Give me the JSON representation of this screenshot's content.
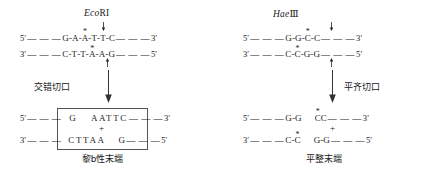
{
  "diagram": {
    "title_hidden": "Restriction enzyme cutting patterns",
    "panels": [
      {
        "id": "ecori",
        "enzyme": {
          "italic_part": "Eco",
          "roman_part": "RI"
        },
        "top_strand": {
          "five_prime": "5′",
          "three_prime": "3′",
          "left_flank": "— — —",
          "right_flank": "— — —",
          "bases": [
            "G",
            "A",
            "A",
            "T",
            "T",
            "C"
          ],
          "starred_index": 2,
          "cut_after_index": 0
        },
        "bottom_strand": {
          "five_prime": "5′",
          "three_prime": "3′",
          "left_flank": "— — —",
          "right_flank": "— — —",
          "bases": [
            "C",
            "T",
            "T",
            "A",
            "A",
            "G"
          ],
          "starred_index": 3,
          "cut_after_index": 4
        },
        "process_label": "交错切口",
        "process_label_side": "left",
        "product": {
          "boxed": true,
          "top": {
            "five_prime": "5′",
            "three_prime": "3′",
            "left_flank": "— — —",
            "right_flank": "— — —",
            "left_fragment": [
              "G"
            ],
            "right_fragment": [
              "A",
              "A",
              "T",
              "T",
              "C"
            ]
          },
          "bottom": {
            "five_prime": "5′",
            "three_prime": "3′",
            "left_flank": "— — —",
            "right_flank": "— — —",
            "left_fragment": [
              "C",
              "T",
              "T",
              "A",
              "A"
            ],
            "right_fragment": [
              "G"
            ]
          },
          "plus": "+",
          "result_label": "黎b性末端"
        }
      },
      {
        "id": "haeiii",
        "enzyme": {
          "italic_part": "Hae",
          "roman_part": "Ⅲ"
        },
        "top_strand": {
          "five_prime": "5′",
          "three_prime": "3′",
          "left_flank": "— — —",
          "right_flank": "— — —",
          "bases": [
            "G",
            "G",
            "C",
            "C"
          ],
          "starred_index": 2,
          "cut_after_index": 1
        },
        "bottom_strand": {
          "five_prime": "5′",
          "three_prime": "3′",
          "left_flank": "— — —",
          "right_flank": "— — —",
          "bases": [
            "C",
            "C",
            "G",
            "G"
          ],
          "starred_index": 1,
          "cut_after_index": 1
        },
        "process_label": "平齐切口",
        "process_label_side": "right",
        "product": {
          "boxed": false,
          "top": {
            "five_prime": "5′",
            "three_prime": "3′",
            "left_flank": "— — —",
            "right_flank": "— — —",
            "left_fragment": [
              "G",
              "G"
            ],
            "right_fragment": [
              "C",
              "C"
            ]
          },
          "bottom": {
            "five_prime": "5′",
            "three_prime": "3′",
            "left_flank": "— — —",
            "right_flank": "— — —",
            "left_fragment": [
              "C",
              "C"
            ],
            "right_fragment": [
              "G",
              "G"
            ]
          },
          "plus": "+",
          "result_label": "平整末端"
        }
      }
    ]
  }
}
